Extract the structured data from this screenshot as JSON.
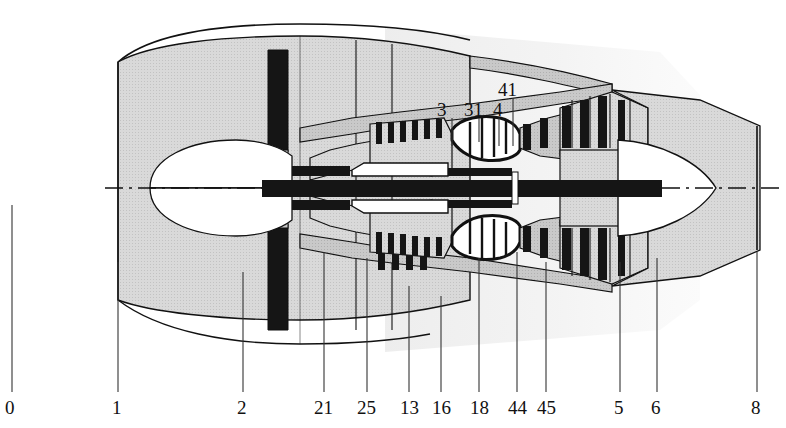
{
  "figure": {
    "type": "technical-cutaway-diagram",
    "width": 786,
    "height": 428,
    "background_color": "#ffffff",
    "line_color": "#111111",
    "fill_light": "#d8d8d8",
    "fill_mid": "#bdbdbd",
    "fill_dark": "#1a1a1a",
    "centerline_y": 188
  },
  "station_labels_bottom": [
    {
      "id": "station-0",
      "text": "0",
      "x": 5,
      "y": 398,
      "leader_x": 12,
      "leader_top": 205,
      "leader_bottom": 392
    },
    {
      "id": "station-1",
      "text": "1",
      "x": 112,
      "y": 398,
      "leader_x": 118,
      "leader_top": 262,
      "leader_bottom": 392
    },
    {
      "id": "station-2",
      "text": "2",
      "x": 237,
      "y": 398,
      "leader_x": 243,
      "leader_top": 272,
      "leader_bottom": 392
    },
    {
      "id": "station-21",
      "text": "21",
      "x": 314,
      "y": 398,
      "leader_x": 324,
      "leader_top": 252,
      "leader_bottom": 392
    },
    {
      "id": "station-25",
      "text": "25",
      "x": 357,
      "y": 398,
      "leader_x": 367,
      "leader_top": 258,
      "leader_bottom": 392
    },
    {
      "id": "station-13",
      "text": "13",
      "x": 400,
      "y": 398,
      "leader_x": 409,
      "leader_top": 286,
      "leader_bottom": 392
    },
    {
      "id": "station-16",
      "text": "16",
      "x": 432,
      "y": 398,
      "leader_x": 441,
      "leader_top": 296,
      "leader_bottom": 392
    },
    {
      "id": "station-18",
      "text": "18",
      "x": 470,
      "y": 398,
      "leader_x": 479,
      "leader_top": 258,
      "leader_bottom": 392
    },
    {
      "id": "station-44",
      "text": "44",
      "x": 508,
      "y": 398,
      "leader_x": 517,
      "leader_top": 252,
      "leader_bottom": 392
    },
    {
      "id": "station-45",
      "text": "45",
      "x": 537,
      "y": 398,
      "leader_x": 546,
      "leader_top": 262,
      "leader_bottom": 392
    },
    {
      "id": "station-5",
      "text": "5",
      "x": 614,
      "y": 398,
      "leader_x": 620,
      "leader_top": 262,
      "leader_bottom": 392
    },
    {
      "id": "station-6",
      "text": "6",
      "x": 651,
      "y": 398,
      "leader_x": 657,
      "leader_top": 258,
      "leader_bottom": 392
    },
    {
      "id": "station-8",
      "text": "8",
      "x": 751,
      "y": 398,
      "leader_x": 757,
      "leader_top": 252,
      "leader_bottom": 392
    }
  ],
  "station_labels_top": [
    {
      "id": "station-3",
      "text": "3",
      "x": 437,
      "y": 100,
      "leader_x": 452,
      "leader_top": 118,
      "leader_bottom": 146
    },
    {
      "id": "station-31",
      "text": "31",
      "x": 464,
      "y": 100,
      "leader_x": 479,
      "leader_top": 118,
      "leader_bottom": 142
    },
    {
      "id": "station-4",
      "text": "4",
      "x": 493,
      "y": 100,
      "leader_x": 499,
      "leader_top": 118,
      "leader_bottom": 146
    },
    {
      "id": "station-41",
      "text": "41",
      "x": 498,
      "y": 80,
      "leader_x": 513,
      "leader_top": 98,
      "leader_bottom": 146
    }
  ],
  "components": {
    "nacelle": "fan-cowl-outer-casing",
    "fan": "fan-blade",
    "booster": "low-pressure-compressor",
    "hp_compressor": "high-pressure-compressor",
    "combustor": "annular-combustor",
    "hp_turbine": "high-pressure-turbine",
    "lp_turbine": "low-pressure-turbine",
    "shaft": "rotor-shaft",
    "plug": "exhaust-plug-tail-cone",
    "bypass_duct": "bypass-duct",
    "centerline": "engine-axis-centerline"
  }
}
